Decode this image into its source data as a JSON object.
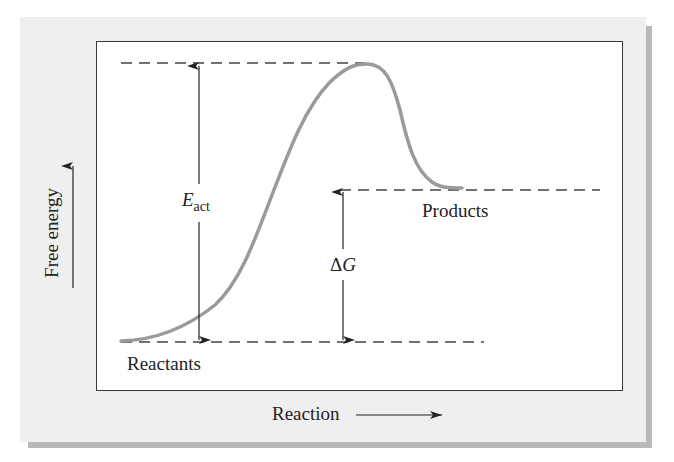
{
  "diagram": {
    "axes": {
      "y_label": "Free energy",
      "x_label": "Reaction"
    },
    "levels": {
      "reactants_label": "Reactants",
      "products_label": "Products"
    },
    "annotations": {
      "activation_energy": {
        "symbol": "E",
        "subscript": "act"
      },
      "delta_g": {
        "symbol": "ΔG"
      }
    },
    "colors": {
      "curve": "#9a9a9a",
      "dashes": "#444444",
      "arrows": "#222222",
      "panel": "#efefef",
      "shadow": "#b9b9b9",
      "frame": "#3a3a3a"
    }
  },
  "chart_data": {
    "type": "line",
    "title": "",
    "xlabel": "Reaction",
    "ylabel": "Free energy",
    "series": [
      {
        "name": "Reaction energy profile",
        "points_px": [
          [
            121,
            341
          ],
          [
            160,
            335
          ],
          [
            199,
            316
          ],
          [
            230,
            292
          ],
          [
            245,
            262
          ],
          [
            270,
            200
          ],
          [
            285,
            160
          ],
          [
            305,
            120
          ],
          [
            325,
            90
          ],
          [
            350,
            70
          ],
          [
            365,
            64
          ],
          [
            380,
            66
          ],
          [
            395,
            90
          ],
          [
            405,
            130
          ],
          [
            415,
            165
          ],
          [
            430,
            182
          ],
          [
            455,
            188
          ],
          [
            462,
            188
          ]
        ]
      }
    ],
    "levels": [
      {
        "name": "Reactants",
        "relative_energy": 0
      },
      {
        "name": "Transition state (peak)",
        "relative_energy": 1.0
      },
      {
        "name": "Products",
        "relative_energy": 0.55
      }
    ],
    "annotations": [
      "E_act (reactants to peak)",
      "ΔG (reactants to products)"
    ],
    "grid": false,
    "legend": "none"
  }
}
